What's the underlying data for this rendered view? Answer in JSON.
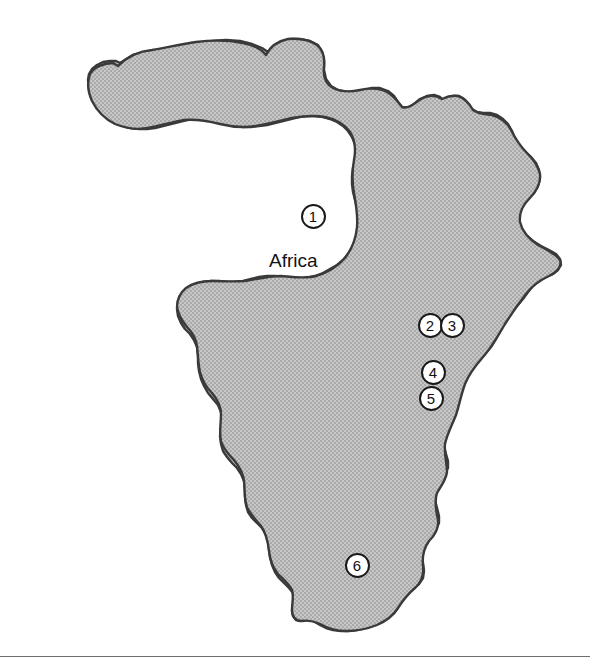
{
  "figure": {
    "type": "reference-map",
    "subject": "Africa",
    "background_color": "#ffffff",
    "land_fill_color": "#b9b9b9",
    "land_outline_color": "#3a3a3a",
    "marker_fill_color": "#ffffff",
    "marker_ring_color": "#1a1a1a",
    "label_color": "#131313"
  },
  "labels": {
    "continent": "Africa"
  },
  "markers": [
    {
      "id": "marker-1",
      "number": "1",
      "x": 313,
      "y": 216
    },
    {
      "id": "marker-2",
      "number": "2",
      "x": 430,
      "y": 325
    },
    {
      "id": "marker-3",
      "number": "3",
      "x": 452,
      "y": 325
    },
    {
      "id": "marker-4",
      "number": "4",
      "x": 433,
      "y": 372
    },
    {
      "id": "marker-5",
      "number": "5",
      "x": 431,
      "y": 398
    },
    {
      "id": "marker-6",
      "number": "6",
      "x": 357,
      "y": 565
    }
  ],
  "label_position": {
    "continent_x": 269,
    "continent_y": 250
  },
  "rule": {
    "y": 656
  }
}
